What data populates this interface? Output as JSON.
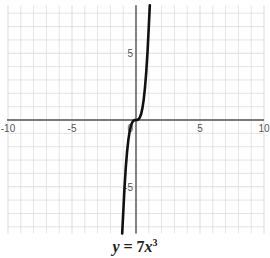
{
  "chart_data": {
    "type": "line",
    "equation": "y = 7x^3",
    "xlabel": "",
    "ylabel": "",
    "xlim": [
      -10,
      10
    ],
    "ylim": [
      -8.5,
      8.6
    ],
    "x_ticks": [
      -10,
      -5,
      5,
      10
    ],
    "y_ticks": [
      5,
      -5
    ],
    "x_tick_labels": [
      "-10",
      "-5",
      "5",
      "10"
    ],
    "y_tick_labels": [
      "5",
      "-5"
    ],
    "origin_label": "0",
    "grid": true,
    "grid_step": 1,
    "series": [
      {
        "name": "y = 7x^3",
        "color": "#111111",
        "x": [
          -1.08,
          -1.0,
          -0.9,
          -0.8,
          -0.7,
          -0.6,
          -0.5,
          -0.4,
          -0.3,
          -0.2,
          -0.1,
          0,
          0.1,
          0.2,
          0.3,
          0.4,
          0.5,
          0.6,
          0.7,
          0.8,
          0.9,
          1.0,
          1.08
        ],
        "y": [
          -8.82,
          -7.0,
          -5.1,
          -3.58,
          -2.4,
          -1.51,
          -0.875,
          -0.448,
          -0.189,
          -0.056,
          -0.007,
          0,
          0.007,
          0.056,
          0.189,
          0.448,
          0.875,
          1.51,
          2.4,
          3.58,
          5.1,
          7.0,
          8.82
        ]
      }
    ]
  },
  "caption": {
    "lhs": "y",
    "eq": " = 7",
    "var": "x",
    "exp": "3"
  },
  "colors": {
    "grid": "#dddddd",
    "axis": "#555555",
    "curve": "#111111"
  }
}
